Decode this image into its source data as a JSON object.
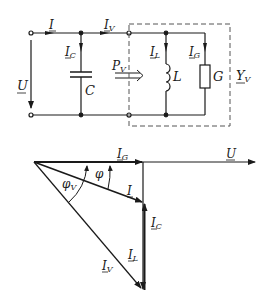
{
  "circuit": {
    "labels": {
      "I": "I",
      "I_V": "I",
      "I_V_sub": "V",
      "I_C": "I",
      "I_C_sub": "C",
      "I_L": "I",
      "I_L_sub": "L",
      "I_G": "I",
      "I_G_sub": "G",
      "U": "U",
      "C": "C",
      "L": "L",
      "G": "G",
      "P_V": "P",
      "P_V_sub": "V",
      "Y_V": "Y",
      "Y_V_sub": "V"
    },
    "components": [
      "capacitor C",
      "inductor L",
      "conductance G"
    ],
    "dashed_box_label": "Y_V"
  },
  "phasor": {
    "labels": {
      "I_G": "I",
      "I_G_sub": "G",
      "U": "U",
      "phi": "φ",
      "phi_V": "φ",
      "phi_V_sub": "V",
      "I": "I",
      "I_C": "I",
      "I_C_sub": "C",
      "I_L": "I",
      "I_L_sub": "L",
      "I_V": "I",
      "I_V_sub": "V"
    },
    "vectors": [
      "U",
      "I_G",
      "I",
      "I_C",
      "I_L",
      "I_V"
    ],
    "colors": {
      "line": "#1a1a1a",
      "dashed": "#555555"
    }
  }
}
